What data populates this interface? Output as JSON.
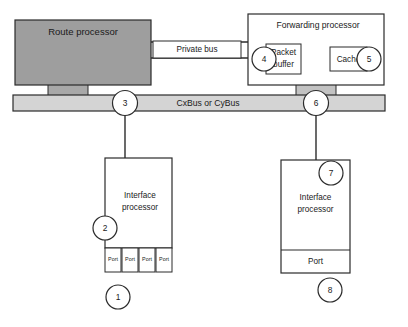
{
  "diagram": {
    "colors": {
      "route_processor_fill": "#9e9e9e",
      "bus_fill": "#d4d4d4",
      "stub_fill": "#b5b5b5",
      "box_fill": "#ffffff",
      "stroke": "#2b2b2b",
      "text": "#1a1a1a"
    },
    "blocks": {
      "route_processor": {
        "label": "Route processor"
      },
      "private_bus": {
        "label": "Private bus"
      },
      "forwarding_processor": {
        "label": "Forwarding processor"
      },
      "packet_buffer": {
        "label": "Packet buffer",
        "line1": "Packet",
        "line2": "buffer"
      },
      "cache": {
        "label": "Cache"
      },
      "bus": {
        "label": "CxBus or CyBus"
      },
      "interface_processor_left": {
        "line1": "Interface",
        "line2": "processor"
      },
      "interface_processor_right": {
        "line1": "Interface",
        "line2": "processor"
      },
      "port_single": {
        "label": "Port"
      }
    },
    "ports_left": [
      {
        "label": "Port"
      },
      {
        "label": "Port"
      },
      {
        "label": "Port"
      },
      {
        "label": "Port"
      }
    ],
    "callouts": [
      {
        "id": "callout-1",
        "number": "1"
      },
      {
        "id": "callout-2",
        "number": "2"
      },
      {
        "id": "callout-3",
        "number": "3"
      },
      {
        "id": "callout-4",
        "number": "4"
      },
      {
        "id": "callout-5",
        "number": "5"
      },
      {
        "id": "callout-6",
        "number": "6"
      },
      {
        "id": "callout-7",
        "number": "7"
      },
      {
        "id": "callout-8",
        "number": "8"
      }
    ]
  }
}
